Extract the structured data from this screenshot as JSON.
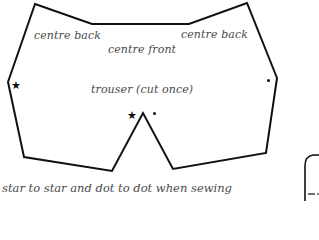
{
  "diagram": {
    "type": "sewing-pattern-piece",
    "piece": {
      "name": "trouser",
      "label": "trouser (cut once)",
      "outline_color": "#111111",
      "outline_points": [
        [
          35,
          4
        ],
        [
          92,
          24
        ],
        [
          189,
          24
        ],
        [
          247,
          3
        ],
        [
          277,
          78
        ],
        [
          266,
          153
        ],
        [
          173,
          169
        ],
        [
          143,
          113
        ],
        [
          112,
          171
        ],
        [
          24,
          157
        ],
        [
          8,
          82
        ]
      ]
    },
    "labels": {
      "centre_back_left": "centre back",
      "centre_front": "centre front",
      "centre_back_right": "centre back",
      "piece_label": "trouser (cut once)"
    },
    "markers": [
      {
        "type": "star",
        "symbol": "★",
        "x": 16,
        "y": 85,
        "meaning": "match star to star"
      },
      {
        "type": "star",
        "symbol": "★",
        "x": 132,
        "y": 115,
        "meaning": "match star to star"
      },
      {
        "type": "dot",
        "symbol": "•",
        "x": 154,
        "y": 113,
        "meaning": "match dot to dot"
      },
      {
        "type": "dot",
        "symbol": "•",
        "x": 268,
        "y": 80,
        "meaning": "match dot to dot"
      }
    ],
    "caption": "star to star and dot to dot when sewing",
    "partial_shape": {
      "description": "partially visible adjacent pattern piece at bottom-right edge"
    }
  }
}
